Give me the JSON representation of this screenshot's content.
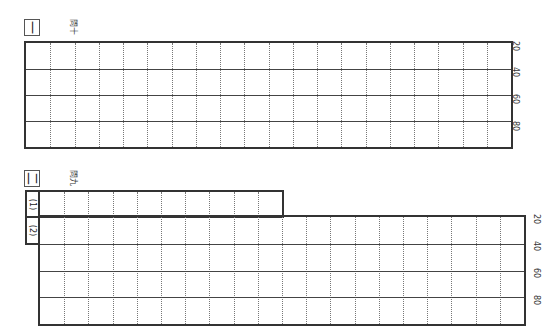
{
  "sections": [
    {
      "id": "section-1",
      "number_glyph": "一",
      "title": "問十",
      "grid": {
        "columns": 20,
        "rows": 4
      },
      "tick_labels": [
        "20",
        "40",
        "60",
        "80"
      ]
    },
    {
      "id": "section-2",
      "number_glyph": "二",
      "title": "問九",
      "subparts": [
        {
          "label": "(1)",
          "columns": 10,
          "rows": 1
        },
        {
          "label": "(2)",
          "columns": 20,
          "rows": 4
        }
      ],
      "tick_labels": [
        "20",
        "40",
        "60",
        "80"
      ]
    }
  ],
  "colors": {
    "border": "#333333",
    "dotted": "#777777",
    "background": "#ffffff"
  }
}
